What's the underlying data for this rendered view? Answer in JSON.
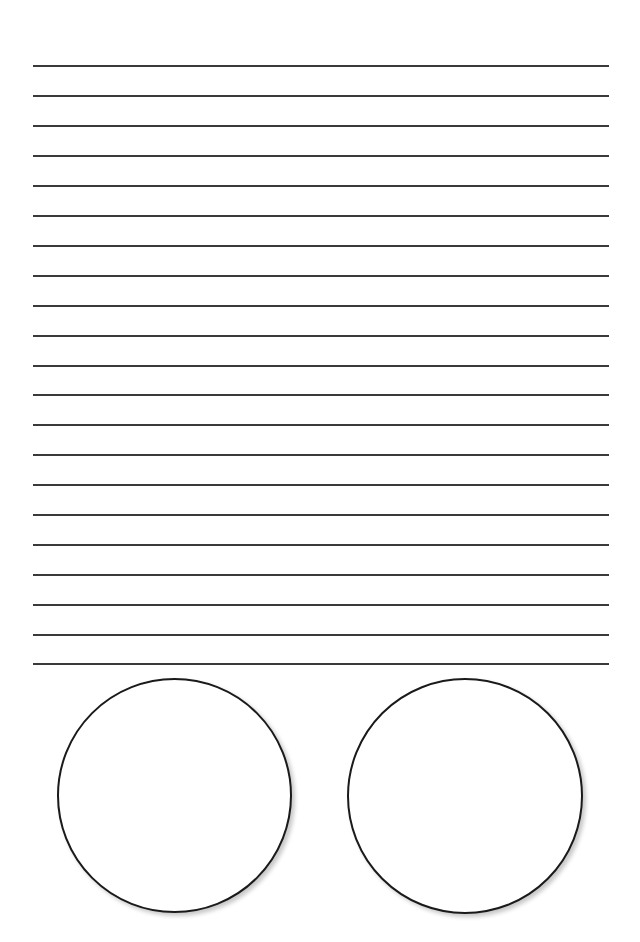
{
  "page": {
    "background": "#ffffff",
    "line_color": "#3a3a3a",
    "circle_border_color": "#1a1a1a"
  },
  "ruled_lines": {
    "count": 21,
    "x_start": 33,
    "x_end": 609,
    "y_positions": [
      66,
      96,
      126,
      156,
      186,
      216,
      246,
      276,
      306,
      336,
      366,
      395,
      425,
      455,
      485,
      515,
      545,
      575,
      605,
      635,
      664
    ]
  },
  "circles": [
    {
      "name": "left-circle",
      "cx": 175,
      "cy": 796,
      "diameter": 236
    },
    {
      "name": "right-circle",
      "cx": 465,
      "cy": 796,
      "diameter": 237
    }
  ]
}
